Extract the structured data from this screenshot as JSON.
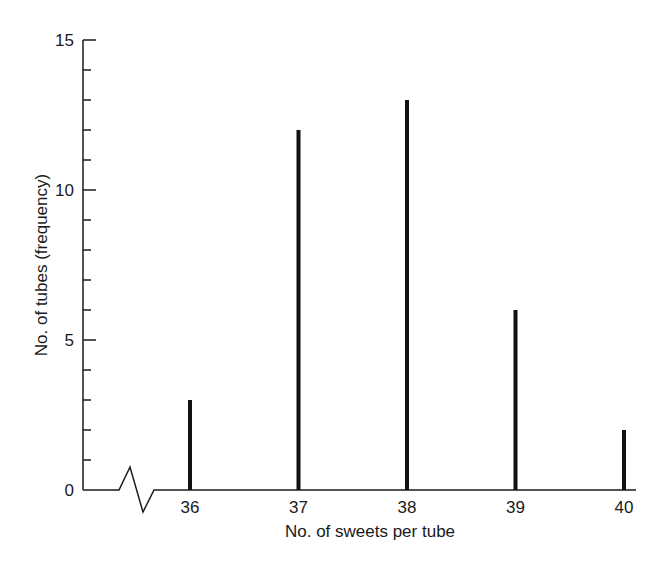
{
  "chart_data": {
    "type": "bar",
    "title": "",
    "xlabel": "No. of sweets per tube",
    "ylabel": "No. of tubes (frequency)",
    "categories": [
      "36",
      "37",
      "38",
      "39",
      "40"
    ],
    "values": [
      3,
      12,
      13,
      6,
      2
    ],
    "ylim": [
      0,
      15
    ],
    "yticks_major": [
      0,
      5,
      10,
      15
    ],
    "yticks_minor_step": 1,
    "grid": false,
    "legend": null,
    "axis_break_on_x": true,
    "bar_style": "thin vertical lines (stick diagram)",
    "bar_color": "#111111"
  }
}
